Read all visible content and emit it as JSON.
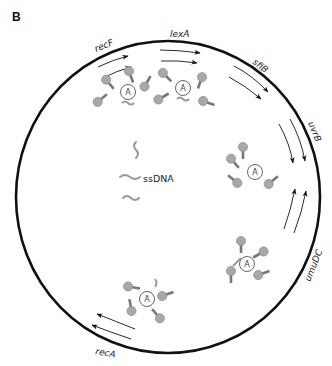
{
  "panel_label": "B",
  "center_label": "ssDNA",
  "complex_label": "A",
  "genes": [
    {
      "name": "recF",
      "x": 106,
      "y": 50,
      "rot": -22
    },
    {
      "name": "lexA",
      "x": 168,
      "y": 38,
      "rot": 0
    },
    {
      "name": "sfiB",
      "x": 252,
      "y": 66,
      "rot": 35
    },
    {
      "name": "uvrB",
      "x": 308,
      "y": 134,
      "rot": 65
    },
    {
      "name": "umuDC",
      "x": 316,
      "y": 255,
      "rot": -65
    },
    {
      "name": "recA",
      "x": 86,
      "y": 354,
      "rot": 12
    }
  ],
  "colors": {
    "circle": "#111111",
    "protein": "#a8a8a8",
    "ssdna": "#9a9a9a",
    "arrow": "#111111"
  }
}
